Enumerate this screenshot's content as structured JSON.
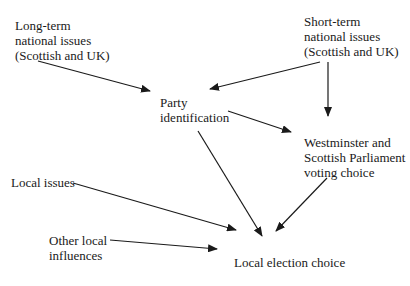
{
  "diagram": {
    "nodes": {
      "long_term": {
        "lines": [
          "Long-term",
          "national issues",
          "(Scottish and UK)"
        ]
      },
      "short_term": {
        "lines": [
          "Short-term",
          "national issues",
          "(Scottish and UK)"
        ]
      },
      "party_id": {
        "lines": [
          "Party",
          "identification"
        ]
      },
      "westminster": {
        "lines": [
          "Westminster and",
          "Scottish Parliament",
          "voting choice"
        ]
      },
      "local_issues": {
        "lines": [
          "Local issues"
        ]
      },
      "other_local": {
        "lines": [
          "Other local",
          "influences"
        ]
      },
      "local_election": {
        "lines": [
          "Local election choice"
        ]
      }
    },
    "edges": [
      {
        "from": "Long-term national issues",
        "to": "Party identification"
      },
      {
        "from": "Short-term national issues",
        "to": "Party identification"
      },
      {
        "from": "Short-term national issues",
        "to": "Westminster and Scottish Parliament voting choice"
      },
      {
        "from": "Party identification",
        "to": "Westminster and Scottish Parliament voting choice"
      },
      {
        "from": "Party identification",
        "to": "Local election choice"
      },
      {
        "from": "Westminster and Scottish Parliament voting choice",
        "to": "Local election choice"
      },
      {
        "from": "Local issues",
        "to": "Local election choice"
      },
      {
        "from": "Other local influences",
        "to": "Local election choice"
      }
    ]
  }
}
